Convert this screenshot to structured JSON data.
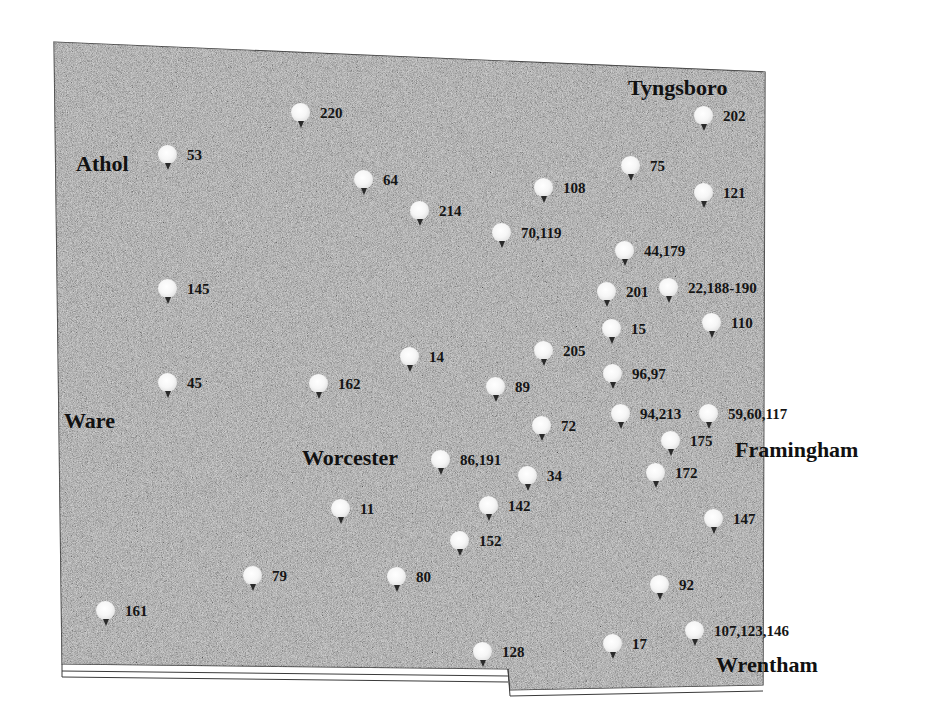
{
  "colors": {
    "background": "#ffffff",
    "region_fill": "#a9a9a9",
    "region_border": "#3a3a3a",
    "marker_head": "#f4f4f4",
    "marker_stem": "#2a2a2a",
    "text": "#151515"
  },
  "cities": [
    {
      "name": "Athol",
      "x": 76,
      "y": 153
    },
    {
      "name": "Tyngsboro",
      "x": 628,
      "y": 77
    },
    {
      "name": "Ware",
      "x": 64,
      "y": 410
    },
    {
      "name": "Worcester",
      "x": 302,
      "y": 447
    },
    {
      "name": "Framingham",
      "x": 735,
      "y": 439
    },
    {
      "name": "Wrentham",
      "x": 716,
      "y": 654
    }
  ],
  "markers": [
    {
      "id": "220",
      "icon": "map-pin-icon",
      "x": 290,
      "y": 103
    },
    {
      "id": "53",
      "icon": "map-pin-icon",
      "x": 157,
      "y": 145
    },
    {
      "id": "64",
      "icon": "map-pin-icon",
      "x": 353,
      "y": 170
    },
    {
      "id": "214",
      "icon": "map-pin-icon",
      "x": 409,
      "y": 201
    },
    {
      "id": "202",
      "icon": "map-pin-icon",
      "x": 693,
      "y": 106
    },
    {
      "id": "75",
      "icon": "map-pin-icon",
      "x": 620,
      "y": 156
    },
    {
      "id": "108",
      "icon": "map-pin-icon",
      "x": 533,
      "y": 178
    },
    {
      "id": "121",
      "icon": "map-pin-icon",
      "x": 693,
      "y": 183
    },
    {
      "id": "70,119",
      "icon": "map-pin-icon",
      "x": 491,
      "y": 223
    },
    {
      "id": "44,179",
      "icon": "map-pin-icon",
      "x": 614,
      "y": 241
    },
    {
      "id": "145",
      "icon": "map-pin-icon",
      "x": 157,
      "y": 279
    },
    {
      "id": "201",
      "icon": "map-pin-icon",
      "x": 596,
      "y": 282
    },
    {
      "id": "22,188-190",
      "icon": "map-pin-icon",
      "x": 658,
      "y": 278
    },
    {
      "id": "15",
      "icon": "map-pin-icon",
      "x": 601,
      "y": 319
    },
    {
      "id": "110",
      "icon": "map-pin-icon",
      "x": 701,
      "y": 313
    },
    {
      "id": "205",
      "icon": "map-pin-icon",
      "x": 533,
      "y": 341
    },
    {
      "id": "14",
      "icon": "map-pin-icon",
      "x": 399,
      "y": 347
    },
    {
      "id": "96,97",
      "icon": "map-pin-icon",
      "x": 602,
      "y": 364
    },
    {
      "id": "45",
      "icon": "map-pin-icon",
      "x": 157,
      "y": 373
    },
    {
      "id": "162",
      "icon": "map-pin-icon",
      "x": 308,
      "y": 374
    },
    {
      "id": "89",
      "icon": "map-pin-icon",
      "x": 485,
      "y": 377
    },
    {
      "id": "94,213",
      "icon": "map-pin-icon",
      "x": 610,
      "y": 404
    },
    {
      "id": "59,60,117",
      "icon": "map-pin-icon",
      "x": 698,
      "y": 404
    },
    {
      "id": "72",
      "icon": "map-pin-icon",
      "x": 531,
      "y": 416
    },
    {
      "id": "175",
      "icon": "map-pin-icon",
      "x": 660,
      "y": 431
    },
    {
      "id": "86,191",
      "icon": "map-pin-icon",
      "x": 430,
      "y": 450
    },
    {
      "id": "34",
      "icon": "map-pin-icon",
      "x": 517,
      "y": 466
    },
    {
      "id": "172",
      "icon": "map-pin-icon",
      "x": 645,
      "y": 463
    },
    {
      "id": "11",
      "icon": "map-pin-icon",
      "x": 330,
      "y": 499
    },
    {
      "id": "142",
      "icon": "map-pin-icon",
      "x": 478,
      "y": 496
    },
    {
      "id": "147",
      "icon": "map-pin-icon",
      "x": 703,
      "y": 509
    },
    {
      "id": "152",
      "icon": "map-pin-icon",
      "x": 449,
      "y": 531
    },
    {
      "id": "79",
      "icon": "map-pin-icon",
      "x": 242,
      "y": 566
    },
    {
      "id": "80",
      "icon": "map-pin-icon",
      "x": 386,
      "y": 567
    },
    {
      "id": "92",
      "icon": "map-pin-icon",
      "x": 649,
      "y": 575
    },
    {
      "id": "161",
      "icon": "map-pin-icon",
      "x": 95,
      "y": 601
    },
    {
      "id": "107,123,146",
      "icon": "map-pin-icon",
      "x": 684,
      "y": 621
    },
    {
      "id": "17",
      "icon": "map-pin-icon",
      "x": 602,
      "y": 634
    },
    {
      "id": "128",
      "icon": "map-pin-icon",
      "x": 472,
      "y": 642
    }
  ]
}
